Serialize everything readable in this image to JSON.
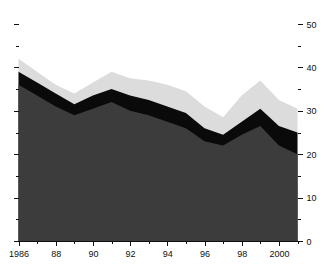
{
  "chart_data": {
    "type": "area",
    "stacked": true,
    "title": "",
    "subtitle": "",
    "xlabel": "",
    "ylabel": "",
    "grid": false,
    "legend": "none",
    "x": [
      1986,
      1987,
      1988,
      1989,
      1990,
      1991,
      1992,
      1993,
      1994,
      1995,
      1996,
      1997,
      1998,
      1999,
      2000,
      2001
    ],
    "xlim": [
      1986,
      2001
    ],
    "ylim": [
      0,
      50
    ],
    "y_axis_side": "right",
    "x_tick_labels": [
      "1986",
      "",
      "88",
      "",
      "90",
      "",
      "92",
      "",
      "94",
      "",
      "96",
      "",
      "98",
      "",
      "2000",
      ""
    ],
    "x_major_ticks": [
      1986,
      1988,
      1990,
      1992,
      1994,
      1996,
      1998,
      2000
    ],
    "y_major_ticks": [
      0,
      10,
      20,
      30,
      40,
      50
    ],
    "y_minor_ticks": [
      5,
      15,
      25,
      35,
      45
    ],
    "y_tick_labels": [
      "0",
      "10",
      "20",
      "30",
      "40",
      "50"
    ],
    "series": [
      {
        "name": "series-dark",
        "color": "#3c3c3c",
        "values": [
          36.0,
          33.5,
          31.0,
          29.0,
          30.5,
          32.0,
          30.0,
          29.0,
          27.5,
          26.0,
          23.0,
          22.0,
          24.5,
          26.5,
          22.0,
          20.0
        ]
      },
      {
        "name": "series-black",
        "color": "#0a0a0a",
        "values": [
          3.0,
          3.0,
          3.0,
          2.5,
          3.0,
          3.0,
          3.5,
          3.5,
          3.5,
          3.5,
          3.0,
          2.5,
          3.0,
          4.0,
          4.5,
          5.0
        ]
      },
      {
        "name": "series-light",
        "color": "#dcdcdc",
        "values": [
          3.0,
          2.5,
          2.0,
          2.5,
          3.0,
          4.0,
          4.0,
          4.5,
          5.0,
          5.0,
          5.0,
          4.0,
          6.0,
          6.5,
          6.0,
          5.5
        ]
      }
    ],
    "totals": [
      42.0,
      39.0,
      36.0,
      34.0,
      36.5,
      39.0,
      37.5,
      37.0,
      36.0,
      34.5,
      31.0,
      28.5,
      33.5,
      37.0,
      32.5,
      30.5
    ]
  },
  "colors": {
    "background": "#ffffff",
    "axis": "#111111",
    "series_dark": "#3c3c3c",
    "series_black": "#0a0a0a",
    "series_light": "#dcdcdc"
  }
}
